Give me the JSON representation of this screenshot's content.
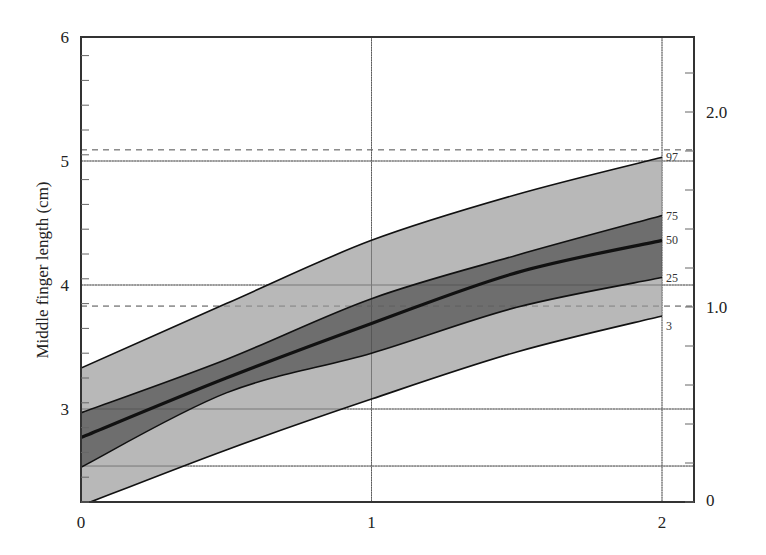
{
  "chart_data": {
    "type": "area",
    "title": "",
    "xlabel": "",
    "ylabel": "Middle finger length (cm)",
    "xlim": [
      0,
      2.11
    ],
    "ylim": [
      2.25,
      6
    ],
    "x_ticks": [
      0,
      1,
      2
    ],
    "x_tick_labels": [
      "0",
      "1",
      "2"
    ],
    "y_ticks": [
      3,
      4,
      5,
      6
    ],
    "y_tick_labels": [
      "3",
      "4",
      "5",
      "6"
    ],
    "y_minor_tick_step": 0.2,
    "right_axis": {
      "ylim": [
        0,
        2.4
      ],
      "ticks": [
        0,
        1.0,
        2.0
      ],
      "tick_labels": [
        "0",
        "1.0",
        "2.0"
      ],
      "minor_tick_step": 0.2
    },
    "grid": {
      "vertical_x": [
        1,
        2
      ],
      "horizontal_solid_y": [
        2.54,
        3,
        4,
        5
      ],
      "horizontal_dashed_y": [
        3.83,
        5.09
      ]
    },
    "x": [
      0,
      0.5,
      1,
      1.5,
      2
    ],
    "series": [
      {
        "name": "97",
        "values": [
          3.33,
          3.85,
          4.36,
          4.73,
          5.03
        ]
      },
      {
        "name": "75",
        "values": [
          2.97,
          3.4,
          3.89,
          4.24,
          4.56
        ]
      },
      {
        "name": "50",
        "values": [
          2.77,
          3.25,
          3.69,
          4.1,
          4.36
        ]
      },
      {
        "name": "25",
        "values": [
          2.53,
          3.13,
          3.45,
          3.82,
          4.06
        ]
      },
      {
        "name": "3",
        "values": [
          2.22,
          2.67,
          3.08,
          3.46,
          3.75
        ]
      }
    ],
    "bands": [
      {
        "from": "3",
        "to": "97",
        "color": "#b8b8b8"
      },
      {
        "from": "25",
        "to": "75",
        "color": "#6e6e6e"
      }
    ],
    "legend": "inline percentile labels at right end of curves"
  },
  "colors": {
    "outer_band": "#b8b8b8",
    "inner_band": "#6e6e6e",
    "line": "#111111",
    "grid": "#777777"
  }
}
